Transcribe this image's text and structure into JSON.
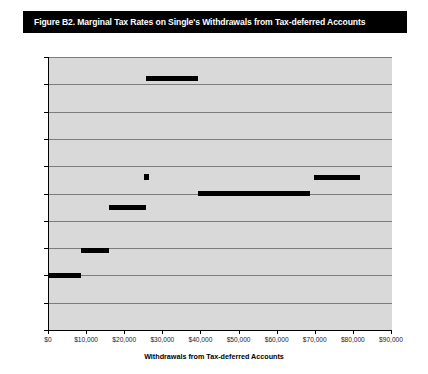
{
  "figure": {
    "title": "Figure B2. Marginal Tax Rates on Single's Withdrawals from Tax-deferred Accounts",
    "title_bg_color": "#000000",
    "title_text_color": "#ffffff",
    "plot_bg_color": "#d9d9d9",
    "series_color": "#000000",
    "gridline_color": "#7d7d7d"
  },
  "chart_data": {
    "type": "bar",
    "title": "Figure B2. Marginal Tax Rates on Single's Withdrawals from Tax-deferred Accounts",
    "xlabel": "Withdrawals from Tax-deferred Accounts",
    "ylabel": "",
    "xlim": [
      0,
      90000
    ],
    "ylim": [
      0,
      0.5
    ],
    "grid": true,
    "legend": "none",
    "x_ticks": [
      0,
      10000,
      20000,
      30000,
      40000,
      50000,
      60000,
      70000,
      80000,
      90000
    ],
    "x_tick_labels": [
      "$0",
      "$10,000",
      "$20,000",
      "$30,000",
      "$40,000",
      "$50,000",
      "$60,000",
      "$70,000",
      "$80,000",
      "$90,000"
    ],
    "y_ticks": [
      0,
      0.05,
      0.1,
      0.15,
      0.2,
      0.25,
      0.3,
      0.35,
      0.4,
      0.45,
      0.5
    ],
    "y_tick_labels": [
      "0",
      "0.05",
      "0.1",
      "0.15",
      "0.2",
      "0.25",
      "0.3",
      "0.35",
      "0.4",
      "0.45",
      "0.5"
    ],
    "segments": [
      {
        "label": "segment-1",
        "x_start": 0,
        "x_end": 8500,
        "rate": 0.1
      },
      {
        "label": "segment-2",
        "x_start": 8500,
        "x_end": 15800,
        "rate": 0.145
      },
      {
        "label": "segment-3",
        "x_start": 15800,
        "x_end": 25500,
        "rate": 0.225
      },
      {
        "label": "segment-4",
        "x_start": 25500,
        "x_end": 39000,
        "rate": 0.46
      },
      {
        "label": "segment-5",
        "x_start": 39000,
        "x_end": 68500,
        "rate": 0.25
      },
      {
        "label": "segment-6",
        "x_start": 69500,
        "x_end": 81500,
        "rate": 0.28
      }
    ],
    "markers": [
      {
        "label": "marker-1",
        "x": 25700,
        "rate": 0.28
      }
    ],
    "categories": [
      "$0-$8,500",
      "$8,500-$15,800",
      "$15,800-$25,500",
      "$25,500-$39,000",
      "$39,000-$68,500",
      "$69,500-$81,500"
    ],
    "values": [
      0.1,
      0.145,
      0.225,
      0.46,
      0.25,
      0.28
    ]
  }
}
